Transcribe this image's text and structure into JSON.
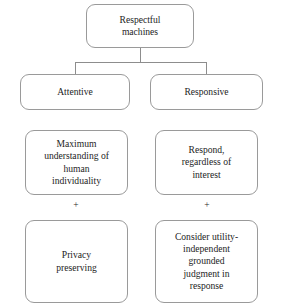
{
  "diagram": {
    "colors": {
      "background": "#ffffff",
      "box_border": "#9a9a9a",
      "connector": "#8d8d8d",
      "text": "#1d1d1d"
    },
    "nodes": {
      "root": {
        "label": "Respectful\nmachines"
      },
      "attentive": {
        "label": "Attentive"
      },
      "responsive": {
        "label": "Responsive"
      },
      "max_understanding": {
        "label": "Maximum\nunderstanding of\nhuman\nindividuality"
      },
      "respond": {
        "label": "Respond,\nregardless of\ninterest"
      },
      "privacy": {
        "label": "Privacy\npreserving"
      },
      "judgment": {
        "label": "Consider utility-\nindependent\ngrounded\njudgment in\nresponse"
      }
    },
    "operators": {
      "left_plus": "+",
      "right_plus": "+"
    }
  }
}
